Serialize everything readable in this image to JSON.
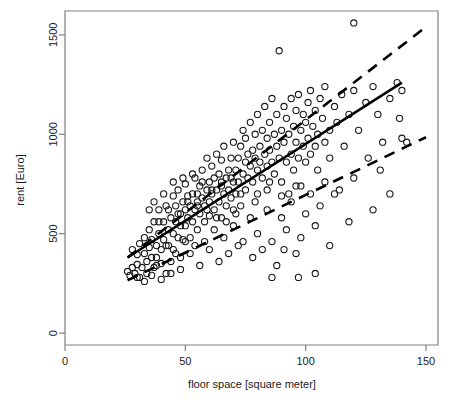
{
  "chart_data": {
    "type": "scatter",
    "title": "",
    "xlabel": "floor space [square meter]",
    "ylabel": "rent [Euro]",
    "xlim": [
      0,
      155
    ],
    "ylim": [
      -60,
      1620
    ],
    "xticks": [
      0,
      50,
      100,
      150
    ],
    "yticks": [
      0,
      500,
      1000,
      1500
    ],
    "xtick_labels": [
      "0",
      "50",
      "100",
      "150"
    ],
    "ytick_labels": [
      "0",
      "500",
      "1000",
      "1500"
    ],
    "grid": false,
    "legend": "none",
    "point_marker": "open-circle",
    "point_color": "#1a1a1a",
    "frame_color": "#808080",
    "background": "#ffffff",
    "series": [
      {
        "name": "observations",
        "marker": "circle-open",
        "points": [
          [
            26,
            310
          ],
          [
            27,
            290
          ],
          [
            28,
            330
          ],
          [
            28,
            420
          ],
          [
            29,
            300
          ],
          [
            30,
            345
          ],
          [
            30,
            395
          ],
          [
            31,
            280
          ],
          [
            31,
            450
          ],
          [
            32,
            330
          ],
          [
            33,
            400
          ],
          [
            33,
            480
          ],
          [
            34,
            360
          ],
          [
            34,
            300
          ],
          [
            35,
            430
          ],
          [
            35,
            520
          ],
          [
            36,
            380
          ],
          [
            36,
            470
          ],
          [
            37,
            330
          ],
          [
            37,
            560
          ],
          [
            38,
            440
          ],
          [
            38,
            380
          ],
          [
            39,
            500
          ],
          [
            39,
            620
          ],
          [
            40,
            420
          ],
          [
            40,
            350
          ],
          [
            41,
            470
          ],
          [
            41,
            560
          ],
          [
            42,
            300
          ],
          [
            42,
            640
          ],
          [
            43,
            520
          ],
          [
            43,
            440
          ],
          [
            44,
            580
          ],
          [
            44,
            360
          ],
          [
            45,
            500
          ],
          [
            45,
            690
          ],
          [
            45,
            420
          ],
          [
            46,
            560
          ],
          [
            46,
            640
          ],
          [
            47,
            480
          ],
          [
            47,
            720
          ],
          [
            48,
            600
          ],
          [
            48,
            540
          ],
          [
            48,
            380
          ],
          [
            49,
            660
          ],
          [
            49,
            470
          ],
          [
            50,
            620
          ],
          [
            50,
            750
          ],
          [
            50,
            540
          ],
          [
            51,
            580
          ],
          [
            51,
            690
          ],
          [
            52,
            640
          ],
          [
            52,
            480
          ],
          [
            53,
            700
          ],
          [
            53,
            560
          ],
          [
            54,
            620
          ],
          [
            54,
            780
          ],
          [
            55,
            660
          ],
          [
            55,
            520
          ],
          [
            55,
            700
          ],
          [
            56,
            740
          ],
          [
            56,
            600
          ],
          [
            57,
            680
          ],
          [
            57,
            820
          ],
          [
            58,
            640
          ],
          [
            58,
            560
          ],
          [
            59,
            720
          ],
          [
            59,
            880
          ],
          [
            60,
            660
          ],
          [
            60,
            760
          ],
          [
            60,
            590
          ],
          [
            61,
            700
          ],
          [
            61,
            840
          ],
          [
            62,
            780
          ],
          [
            62,
            620
          ],
          [
            63,
            720
          ],
          [
            63,
            900
          ],
          [
            64,
            660
          ],
          [
            64,
            800
          ],
          [
            65,
            740
          ],
          [
            65,
            580
          ],
          [
            65,
            870
          ],
          [
            66,
            700
          ],
          [
            66,
            940
          ],
          [
            67,
            780
          ],
          [
            67,
            640
          ],
          [
            68,
            820
          ],
          [
            68,
            720
          ],
          [
            69,
            880
          ],
          [
            69,
            680
          ],
          [
            70,
            760
          ],
          [
            70,
            960
          ],
          [
            70,
            620
          ],
          [
            71,
            820
          ],
          [
            71,
            700
          ],
          [
            72,
            880
          ],
          [
            72,
            760
          ],
          [
            73,
            700
          ],
          [
            73,
            940
          ],
          [
            74,
            800
          ],
          [
            74,
            1020
          ],
          [
            75,
            860
          ],
          [
            75,
            720
          ],
          [
            75,
            980
          ],
          [
            76,
            780
          ],
          [
            76,
            900
          ],
          [
            77,
            840
          ],
          [
            77,
            1060
          ],
          [
            78,
            760
          ],
          [
            78,
            920
          ],
          [
            79,
            880
          ],
          [
            79,
            1000
          ],
          [
            80,
            820
          ],
          [
            80,
            700
          ],
          [
            80,
            1100
          ],
          [
            81,
            940
          ],
          [
            81,
            860
          ],
          [
            82,
            780
          ],
          [
            82,
            1020
          ],
          [
            83,
            900
          ],
          [
            83,
            1140
          ],
          [
            84,
            840
          ],
          [
            84,
            980
          ],
          [
            85,
            760
          ],
          [
            85,
            1060
          ],
          [
            85,
            920
          ],
          [
            86,
            1180
          ],
          [
            86,
            860
          ],
          [
            87,
            1000
          ],
          [
            87,
            800
          ],
          [
            88,
            1100
          ],
          [
            88,
            940
          ],
          [
            89,
            1420
          ],
          [
            89,
            880
          ],
          [
            90,
            1020
          ],
          [
            90,
            760
          ],
          [
            91,
            1140
          ],
          [
            91,
            960
          ],
          [
            92,
            860
          ],
          [
            92,
            1080
          ],
          [
            93,
            1000
          ],
          [
            93,
            700
          ],
          [
            94,
            1180
          ],
          [
            94,
            900
          ],
          [
            95,
            1040
          ],
          [
            95,
            820
          ],
          [
            96,
            1120
          ],
          [
            96,
            960
          ],
          [
            97,
            880
          ],
          [
            97,
            1200
          ],
          [
            98,
            1020
          ],
          [
            98,
            740
          ],
          [
            99,
            1100
          ],
          [
            99,
            940
          ],
          [
            100,
            1060
          ],
          [
            100,
            860
          ],
          [
            101,
            1160
          ],
          [
            101,
            980
          ],
          [
            102,
            900
          ],
          [
            102,
            1220
          ],
          [
            103,
            1040
          ],
          [
            104,
            1120
          ],
          [
            104,
            940
          ],
          [
            105,
            1000
          ],
          [
            105,
            820
          ],
          [
            106,
            1180
          ],
          [
            107,
            1080
          ],
          [
            108,
            960
          ],
          [
            108,
            1240
          ],
          [
            110,
            1020
          ],
          [
            110,
            880
          ],
          [
            112,
            1140
          ],
          [
            113,
            1060
          ],
          [
            115,
            1200
          ],
          [
            116,
            940
          ],
          [
            118,
            1100
          ],
          [
            120,
            1560
          ],
          [
            120,
            1220
          ],
          [
            122,
            1020
          ],
          [
            125,
            1160
          ],
          [
            126,
            880
          ],
          [
            128,
            1240
          ],
          [
            130,
            1100
          ],
          [
            132,
            960
          ],
          [
            135,
            1180
          ],
          [
            138,
            1260
          ],
          [
            139,
            1080
          ],
          [
            140,
            1220
          ],
          [
            142,
            960
          ],
          [
            96,
            400
          ],
          [
            88,
            340
          ],
          [
            82,
            420
          ],
          [
            78,
            380
          ],
          [
            72,
            440
          ],
          [
            68,
            400
          ],
          [
            64,
            360
          ],
          [
            60,
            420
          ],
          [
            56,
            340
          ],
          [
            52,
            400
          ],
          [
            48,
            320
          ],
          [
            44,
            300
          ],
          [
            40,
            270
          ],
          [
            36,
            290
          ],
          [
            33,
            260
          ],
          [
            30,
            280
          ],
          [
            104,
            540
          ],
          [
            98,
            480
          ],
          [
            92,
            520
          ],
          [
            86,
            460
          ],
          [
            80,
            500
          ],
          [
            74,
            460
          ],
          [
            70,
            540
          ],
          [
            66,
            480
          ],
          [
            62,
            520
          ],
          [
            58,
            460
          ],
          [
            54,
            440
          ],
          [
            50,
            460
          ],
          [
            46,
            400
          ],
          [
            42,
            440
          ],
          [
            38,
            340
          ],
          [
            112,
            700
          ],
          [
            106,
            640
          ],
          [
            100,
            600
          ],
          [
            94,
            660
          ],
          [
            90,
            580
          ],
          [
            84,
            620
          ],
          [
            77,
            580
          ],
          [
            71,
            600
          ],
          [
            67,
            560
          ],
          [
            63,
            580
          ],
          [
            59,
            620
          ],
          [
            55,
            640
          ],
          [
            51,
            660
          ],
          [
            47,
            600
          ],
          [
            43,
            620
          ],
          [
            39,
            560
          ],
          [
            35,
            620
          ],
          [
            120,
            780
          ],
          [
            114,
            720
          ],
          [
            108,
            760
          ],
          [
            102,
            700
          ],
          [
            96,
            740
          ],
          [
            90,
            690
          ],
          [
            84,
            720
          ],
          [
            79,
            660
          ],
          [
            73,
            640
          ],
          [
            69,
            780
          ],
          [
            65,
            760
          ],
          [
            61,
            720
          ],
          [
            57,
            760
          ],
          [
            53,
            800
          ],
          [
            49,
            780
          ],
          [
            45,
            760
          ],
          [
            41,
            700
          ],
          [
            37,
            660
          ],
          [
            135,
            700
          ],
          [
            128,
            620
          ],
          [
            118,
            560
          ],
          [
            110,
            440
          ],
          [
            104,
            300
          ],
          [
            97,
            280
          ],
          [
            91,
            420
          ],
          [
            86,
            280
          ],
          [
            140,
            980
          ],
          [
            131,
            820
          ]
        ]
      }
    ],
    "lines": [
      {
        "name": "regression-line",
        "style": "solid",
        "color": "#000000",
        "width": 2.6,
        "x0": 26,
        "y0": 380,
        "x1": 140,
        "y1": 1260
      },
      {
        "name": "upper-dashed-line",
        "style": "dashed",
        "color": "#000000",
        "width": 2.6,
        "x0": 26,
        "y0": 380,
        "x1": 150,
        "y1": 1540
      },
      {
        "name": "lower-dashed-line",
        "style": "dashed",
        "color": "#000000",
        "width": 2.6,
        "x0": 26,
        "y0": 265,
        "x1": 150,
        "y1": 985
      }
    ]
  }
}
